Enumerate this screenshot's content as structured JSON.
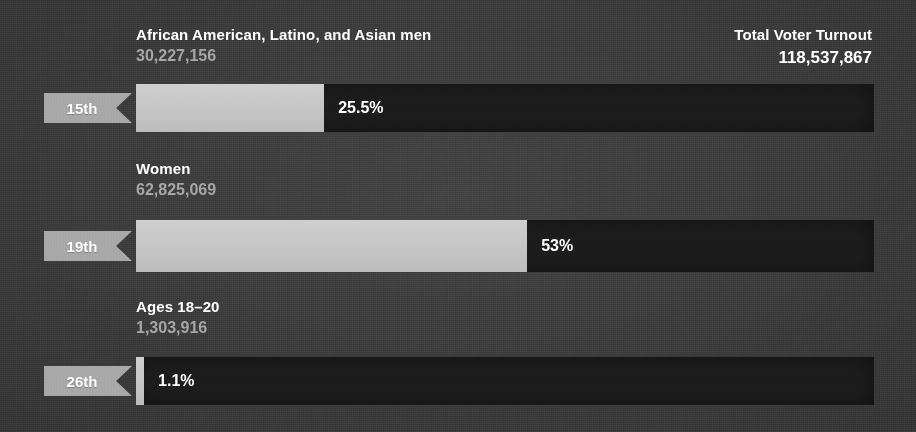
{
  "header": {
    "total_label": "Total Voter Turnout",
    "total_value": "118,537,867"
  },
  "chart_data": {
    "type": "bar",
    "title": "Total Voter Turnout",
    "orientation": "horizontal",
    "total": "118,537,867",
    "total_numeric": 118537867,
    "xlabel": "",
    "ylabel": "",
    "xlim": [
      0,
      100
    ],
    "grid": false,
    "legend": false,
    "categories": [
      "African American, Latino, and Asian men",
      "Women",
      "Ages 18–20"
    ],
    "values": [
      25.5,
      53,
      1.1
    ],
    "counts": [
      30227156,
      62825069,
      1303916
    ],
    "amendments": [
      "15th",
      "19th",
      "26th"
    ],
    "colors": {
      "background": "#3b3b3b",
      "track": "#1d1d1d",
      "fill": "#c6c6c6",
      "ribbon": "#a8a8a8",
      "text": "#ffffff",
      "count_text": "#a6a6a6"
    }
  },
  "groups": [
    {
      "name": "African American, Latino, and Asian men",
      "count": "30,227,156",
      "pct": "25.5%",
      "amendment": "15th",
      "pct_value": 25.5
    },
    {
      "name": "Women",
      "count": "62,825,069",
      "pct": "53%",
      "amendment": "19th",
      "pct_value": 53
    },
    {
      "name": "Ages 18–20",
      "count": "1,303,916",
      "pct": "1.1%",
      "amendment": "26th",
      "pct_value": 1.1
    }
  ]
}
